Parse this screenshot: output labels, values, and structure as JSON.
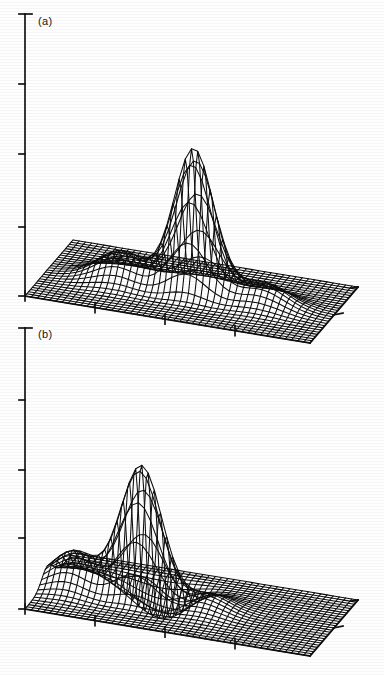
{
  "figure": {
    "type": "two-panel-3d-surface",
    "background_color": "#ffffff",
    "ink_color": "#111111",
    "panels": [
      {
        "id": "a",
        "label": "(a)",
        "label_x": 38,
        "label_y": 17,
        "origin_x": 25,
        "origin_y": 296,
        "axis_top_y": 14,
        "vertical_ticks_y": [
          14,
          84,
          154,
          227,
          296
        ],
        "x_axis_end_x": 310,
        "x_axis_end_y": 343,
        "x_ticks_x": [
          25,
          95,
          165,
          235
        ],
        "depth_axis_end_x": 358,
        "depth_axis_end_y": 287,
        "depth_ticks_t": [
          0.5
        ],
        "base_level_y": 227
      },
      {
        "id": "b",
        "label": "(b)",
        "label_x": 38,
        "label_y": 330,
        "origin_x": 25,
        "origin_y": 609,
        "axis_top_y": 328,
        "vertical_ticks_y": [
          328,
          400,
          470,
          538,
          609
        ],
        "x_axis_end_x": 310,
        "x_axis_end_y": 656,
        "x_ticks_x": [
          25,
          95,
          165,
          235
        ],
        "depth_axis_end_x": 358,
        "depth_axis_end_y": 600,
        "depth_ticks_t": [
          0.5
        ],
        "base_level_y": 538
      }
    ]
  },
  "chart_data": {
    "type": "line",
    "chart_kind": "3d-wireframe-surface-mesh",
    "title": "",
    "subtitle": "",
    "xlabel": "",
    "ylabel": "",
    "zlabel": "",
    "grid": false,
    "legend": "none",
    "annotations": [
      "(a)",
      "(b)"
    ],
    "projection": {
      "mesh_nu": 46,
      "mesh_nv": 26,
      "x_range": [
        -3.0,
        3.0
      ],
      "y_range": [
        -3.0,
        3.0
      ],
      "z_range": [
        -0.35,
        1.0
      ]
    },
    "surfaces": [
      {
        "name": "(a)",
        "description": "central tall Gaussian main lobe with symmetric lower side lobes left and right on a flat base plane",
        "peak_screen_x": 185,
        "peak_screen_y": 47,
        "lobes": [
          {
            "name": "main-lobe",
            "cx": 0.05,
            "cy": 0.0,
            "amp": 1.0,
            "sx": 0.42,
            "sy": 0.5
          },
          {
            "name": "left-side-lobe",
            "cx": -1.45,
            "cy": 0.12,
            "amp": 0.21,
            "sx": 0.5,
            "sy": 0.62
          },
          {
            "name": "right-side-lobe",
            "cx": 1.5,
            "cy": 0.1,
            "amp": 0.15,
            "sx": 0.52,
            "sy": 0.64
          }
        ]
      },
      {
        "name": "(b)",
        "description": "tall Gaussian main lobe shifted left, with a negative trough in front of it and a raised shoulder at the left edge",
        "peak_screen_x": 125,
        "peak_screen_y": 385,
        "lobes": [
          {
            "name": "main-lobe",
            "cx": -1.05,
            "cy": 0.05,
            "amp": 1.0,
            "sx": 0.44,
            "sy": 0.5
          },
          {
            "name": "front-trough",
            "cx": -0.9,
            "cy": -0.95,
            "amp": -0.3,
            "sx": 0.55,
            "sy": 0.5
          },
          {
            "name": "left-shoulder",
            "cx": -2.45,
            "cy": 0.2,
            "amp": 0.26,
            "sx": 0.45,
            "sy": 0.7
          },
          {
            "name": "right-ripple",
            "cx": 0.35,
            "cy": 0.1,
            "amp": 0.1,
            "sx": 0.45,
            "sy": 0.8
          }
        ]
      }
    ],
    "axis_tick_counts": {
      "vertical": 5,
      "horizontal": 4,
      "depth": 2
    }
  }
}
